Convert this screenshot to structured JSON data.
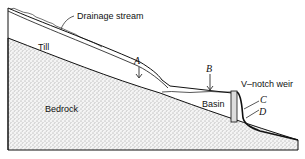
{
  "diagram": {
    "labels": {
      "drainage_stream": "Drainage stream",
      "till": "Till",
      "bedrock": "Bedrock",
      "basin": "Basin",
      "weir": "V–notch weir",
      "point_a": "A",
      "point_b": "B",
      "point_c": "C",
      "point_d": "D"
    },
    "colors": {
      "line": "#111111",
      "bedrock_stipple": "#555555",
      "background": "#ffffff"
    }
  }
}
